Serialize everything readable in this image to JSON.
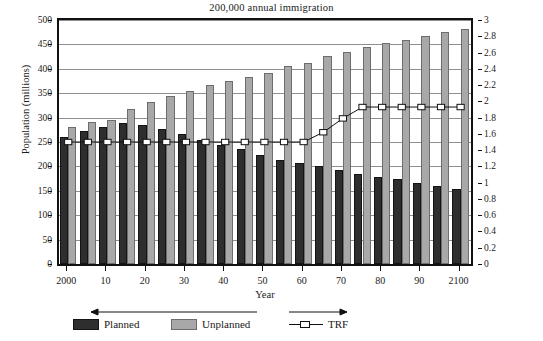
{
  "chart_data": {
    "type": "bar",
    "title": "200,000 annual immigration",
    "xlabel": "Year",
    "ylabel": "Population (millions)",
    "y2label": "TRF (children per woman)",
    "ylim": [
      0,
      500
    ],
    "y2lim": [
      0,
      3
    ],
    "grid": true,
    "legend_position": "bottom",
    "yticks": [
      "0",
      "50",
      "100",
      "150",
      "200",
      "250",
      "300",
      "350",
      "400",
      "450",
      "500"
    ],
    "y2ticks": [
      "0",
      "0.2",
      "0.4",
      "0.6",
      "0.8",
      "1",
      "1.2",
      "1.4",
      "1.6",
      "1.8",
      "2",
      "2.2",
      "2.4",
      "2.6",
      "2.8",
      "3"
    ],
    "xticks": [
      "2000",
      "10",
      "20",
      "30",
      "40",
      "50",
      "60",
      "70",
      "80",
      "90",
      "2100"
    ],
    "categories": [
      "2000",
      "2005",
      "2010",
      "2015",
      "2020",
      "2025",
      "2030",
      "2035",
      "2040",
      "2045",
      "2050",
      "2055",
      "2060",
      "2065",
      "2070",
      "2075",
      "2080",
      "2085",
      "2090",
      "2095",
      "2100"
    ],
    "series": [
      {
        "name": "Planned",
        "axis": "left",
        "color": "#2e2e2e",
        "values": [
          260,
          272,
          280,
          288,
          284,
          277,
          266,
          254,
          244,
          235,
          224,
          213,
          207,
          200,
          192,
          184,
          179,
          175,
          167,
          160,
          153
        ]
      },
      {
        "name": "Unplanned",
        "axis": "left",
        "color": "#a8a8a8",
        "values": [
          280,
          290,
          295,
          317,
          331,
          345,
          355,
          366,
          376,
          383,
          392,
          406,
          412,
          427,
          435,
          444,
          452,
          459,
          467,
          475,
          482
        ]
      },
      {
        "name": "TRF",
        "axis": "right",
        "color": "#111111",
        "marker": "open-square",
        "values": [
          1.5,
          1.5,
          1.5,
          1.5,
          1.5,
          1.5,
          1.5,
          1.5,
          1.5,
          1.5,
          1.5,
          1.5,
          1.5,
          1.62,
          1.79,
          1.93,
          1.93,
          1.93,
          1.93,
          1.93,
          1.93
        ]
      }
    ],
    "annotations": [
      {
        "name": "left-axis-arrow",
        "direction": "left",
        "describes": "Planned and Unplanned read on left axis"
      },
      {
        "name": "right-axis-arrow",
        "direction": "right",
        "describes": "TRF reads on right axis"
      }
    ]
  },
  "legend": {
    "planned_label": "Planned",
    "unplanned_label": "Unplanned",
    "trf_label": "TRF"
  }
}
